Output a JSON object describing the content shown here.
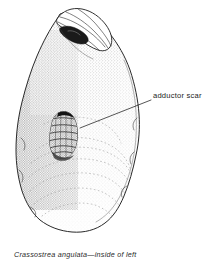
{
  "figure": {
    "domain": "Diagram",
    "kind": "scientific-illustration",
    "background_color": "#ffffff",
    "ink_color": "#1d1d1d",
    "stipple_color": "#555555",
    "width": 213,
    "height": 265
  },
  "caption": {
    "text": "Crassostrea angulata—inside of left",
    "species": "Crassostrea angulata",
    "view": "inside of left",
    "style": "italic"
  },
  "annotations": [
    {
      "id": "adductor-scar",
      "label": "adductor scar",
      "leader_from": {
        "x": 80,
        "y": 128
      },
      "leader_to": {
        "x": 151,
        "y": 100
      },
      "label_anchor": {
        "x": 153,
        "y": 98
      }
    }
  ],
  "features": [
    {
      "id": "hinge",
      "name": "hinge / umbo",
      "description": "folded layered hinge area at top of valve"
    },
    {
      "id": "ligament-pit",
      "name": "ligament pit",
      "description": "dark recess beneath the hinge flap"
    },
    {
      "id": "adductor-scar",
      "name": "adductor scar",
      "description": "dark ridged bell-shaped muscle scar left of centre"
    },
    {
      "id": "growth-lines",
      "name": "growth lines",
      "description": "faint dotted concentric lines across the lower valve"
    },
    {
      "id": "valve-margin",
      "name": "valve margin",
      "description": "irregular undulating outline of the shell"
    }
  ]
}
